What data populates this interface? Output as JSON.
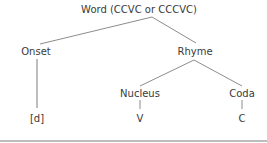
{
  "diagram": {
    "type": "syllable-structure-tree",
    "root": {
      "label": "Word (CCVC or CCCVC)"
    },
    "nodes": {
      "word": {
        "label": "Word (CCVC or CCCVC)",
        "x": 139,
        "y": 10
      },
      "onset": {
        "label": "Onset",
        "x": 36,
        "y": 52
      },
      "rhyme": {
        "label": "Rhyme",
        "x": 195,
        "y": 52
      },
      "nucleus": {
        "label": "Nucleus",
        "x": 140,
        "y": 94
      },
      "coda": {
        "label": "Coda",
        "x": 242,
        "y": 94
      },
      "onset_leaf": {
        "label": "[d]",
        "x": 37,
        "y": 119
      },
      "nucleus_leaf": {
        "label": "V",
        "x": 140,
        "y": 119
      },
      "coda_leaf": {
        "label": "C",
        "x": 242,
        "y": 119
      }
    },
    "edges": [
      {
        "from": "word",
        "to": "onset"
      },
      {
        "from": "word",
        "to": "rhyme"
      },
      {
        "from": "onset",
        "to": "onset_leaf"
      },
      {
        "from": "rhyme",
        "to": "nucleus"
      },
      {
        "from": "rhyme",
        "to": "coda"
      },
      {
        "from": "nucleus",
        "to": "nucleus_leaf"
      },
      {
        "from": "coda",
        "to": "coda_leaf"
      }
    ],
    "colors": {
      "text": "#3a3a3a",
      "line": "#6e6e6e",
      "rule": "#bdbdbd",
      "background": "#ffffff"
    }
  }
}
